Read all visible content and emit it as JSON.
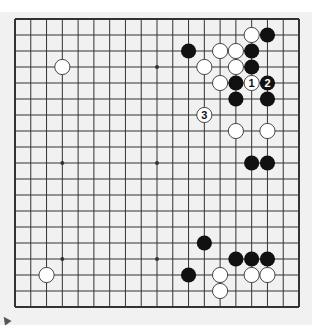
{
  "diagram": {
    "type": "go-board",
    "size": 19,
    "colors": {
      "background": "#f1f1f1",
      "line": "#333333",
      "black_stone": "#111111",
      "white_stone": "#ffffff",
      "white_stroke": "#333333"
    },
    "star_points": [
      [
        3,
        3
      ],
      [
        9,
        3
      ],
      [
        15,
        3
      ],
      [
        3,
        9
      ],
      [
        9,
        9
      ],
      [
        15,
        9
      ],
      [
        3,
        15
      ],
      [
        9,
        15
      ],
      [
        15,
        15
      ]
    ],
    "stones": [
      {
        "color": "black",
        "col": 16,
        "row": 1,
        "label": ""
      },
      {
        "color": "black",
        "col": 11,
        "row": 2,
        "label": ""
      },
      {
        "color": "black",
        "col": 15,
        "row": 2,
        "label": ""
      },
      {
        "color": "black",
        "col": 15,
        "row": 3,
        "label": ""
      },
      {
        "color": "black",
        "col": 14,
        "row": 4,
        "label": ""
      },
      {
        "color": "black",
        "col": 16,
        "row": 4,
        "label": "2"
      },
      {
        "color": "black",
        "col": 14,
        "row": 5,
        "label": ""
      },
      {
        "color": "black",
        "col": 16,
        "row": 5,
        "label": ""
      },
      {
        "color": "black",
        "col": 15,
        "row": 9,
        "label": ""
      },
      {
        "color": "black",
        "col": 16,
        "row": 9,
        "label": ""
      },
      {
        "color": "black",
        "col": 12,
        "row": 14,
        "label": ""
      },
      {
        "color": "black",
        "col": 14,
        "row": 15,
        "label": ""
      },
      {
        "color": "black",
        "col": 15,
        "row": 15,
        "label": ""
      },
      {
        "color": "black",
        "col": 16,
        "row": 15,
        "label": ""
      },
      {
        "color": "black",
        "col": 11,
        "row": 16,
        "label": ""
      },
      {
        "color": "white",
        "col": 15,
        "row": 1,
        "label": ""
      },
      {
        "color": "white",
        "col": 13,
        "row": 2,
        "label": ""
      },
      {
        "color": "white",
        "col": 14,
        "row": 2,
        "label": ""
      },
      {
        "color": "white",
        "col": 12,
        "row": 3,
        "label": ""
      },
      {
        "color": "white",
        "col": 14,
        "row": 3,
        "label": ""
      },
      {
        "color": "white",
        "col": 3,
        "row": 3,
        "label": ""
      },
      {
        "color": "white",
        "col": 13,
        "row": 4,
        "label": ""
      },
      {
        "color": "white",
        "col": 15,
        "row": 4,
        "label": "1"
      },
      {
        "color": "white",
        "col": 12,
        "row": 6,
        "label": "3"
      },
      {
        "color": "white",
        "col": 14,
        "row": 7,
        "label": ""
      },
      {
        "color": "white",
        "col": 16,
        "row": 7,
        "label": ""
      },
      {
        "color": "white",
        "col": 13,
        "row": 16,
        "label": ""
      },
      {
        "color": "white",
        "col": 15,
        "row": 16,
        "label": ""
      },
      {
        "color": "white",
        "col": 16,
        "row": 16,
        "label": ""
      },
      {
        "color": "white",
        "col": 2,
        "row": 16,
        "label": ""
      },
      {
        "color": "white",
        "col": 13,
        "row": 17,
        "label": ""
      }
    ]
  }
}
